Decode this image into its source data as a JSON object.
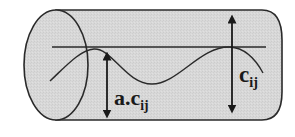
{
  "diagram": {
    "kind": "cylinder cross-section with wave",
    "labels": {
      "a_cij_main": "a.c",
      "a_cij_sub": "ij",
      "cij_main": "c",
      "cij_sub": "ij"
    },
    "colors": {
      "fill": "#d9d9d9",
      "stroke": "#2a2a2a",
      "background": "#ffffff"
    },
    "elements": [
      "cylinder-body",
      "cylinder-left-ellipse",
      "reference-horizontal-line",
      "wave-curve",
      "arrow-a-cij",
      "arrow-cij"
    ]
  }
}
